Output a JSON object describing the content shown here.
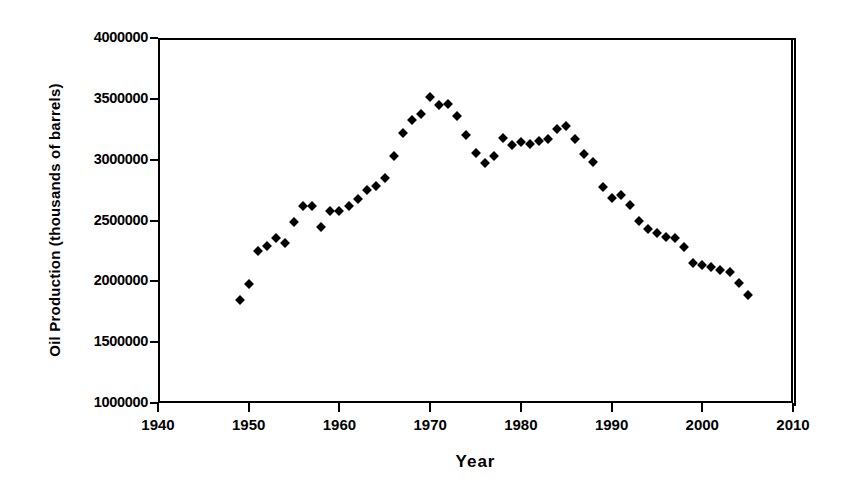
{
  "chart_data": {
    "type": "scatter",
    "title": "",
    "xlabel": "Year",
    "ylabel": "Oil Production (thousands of barrels)",
    "xlim": [
      1940,
      2010
    ],
    "ylim": [
      1000000,
      4000000
    ],
    "xticks": [
      1940,
      1950,
      1960,
      1970,
      1980,
      1990,
      2000,
      2010
    ],
    "xtick_labels": [
      "1940",
      "1950",
      "1960",
      "1970",
      "1980",
      "1990",
      "2000",
      "2010"
    ],
    "yticks": [
      1000000,
      1500000,
      2000000,
      2500000,
      3000000,
      3500000,
      4000000
    ],
    "ytick_labels": [
      "1000000",
      "1500000",
      "2000000",
      "2500000",
      "3000000",
      "3500000",
      "4000000"
    ],
    "grid": false,
    "legend": false,
    "marker": "diamond",
    "marker_color": "#000000",
    "series": [
      {
        "name": "Oil Production",
        "points": [
          [
            1949,
            1845000
          ],
          [
            1950,
            1974000
          ],
          [
            1951,
            2248000
          ],
          [
            1952,
            2290000
          ],
          [
            1953,
            2357000
          ],
          [
            1954,
            2315000
          ],
          [
            1955,
            2484000
          ],
          [
            1956,
            2617000
          ],
          [
            1957,
            2617000
          ],
          [
            1958,
            2449000
          ],
          [
            1959,
            2575000
          ],
          [
            1960,
            2575000
          ],
          [
            1961,
            2622000
          ],
          [
            1962,
            2676000
          ],
          [
            1963,
            2753000
          ],
          [
            1964,
            2787000
          ],
          [
            1965,
            2849000
          ],
          [
            1966,
            3028000
          ],
          [
            1967,
            3216000
          ],
          [
            1968,
            3329000
          ],
          [
            1969,
            3372000
          ],
          [
            1970,
            3517000
          ],
          [
            1971,
            3453000
          ],
          [
            1972,
            3455000
          ],
          [
            1973,
            3361000
          ],
          [
            1974,
            3203000
          ],
          [
            1975,
            3057000
          ],
          [
            1976,
            2976000
          ],
          [
            1977,
            3030000
          ],
          [
            1978,
            3178000
          ],
          [
            1979,
            3121000
          ],
          [
            1980,
            3147000
          ],
          [
            1981,
            3129000
          ],
          [
            1982,
            3157000
          ],
          [
            1983,
            3171000
          ],
          [
            1984,
            3250000
          ],
          [
            1985,
            3274000
          ],
          [
            1986,
            3168000
          ],
          [
            1987,
            3047000
          ],
          [
            1988,
            2979000
          ],
          [
            1989,
            2778000
          ],
          [
            1990,
            2685000
          ],
          [
            1991,
            2707000
          ],
          [
            1992,
            2625000
          ],
          [
            1993,
            2499000
          ],
          [
            1994,
            2431000
          ],
          [
            1995,
            2394000
          ],
          [
            1996,
            2366000
          ],
          [
            1997,
            2355000
          ],
          [
            1998,
            2282000
          ],
          [
            1999,
            2147000
          ],
          [
            2000,
            2131000
          ],
          [
            2001,
            2118000
          ],
          [
            2002,
            2097000
          ],
          [
            2003,
            2073000
          ],
          [
            2004,
            1983000
          ],
          [
            2005,
            1890000
          ]
        ]
      }
    ]
  },
  "axes": {
    "x_title": "Year",
    "y_title": "Oil Production (thousands of barrels)"
  }
}
